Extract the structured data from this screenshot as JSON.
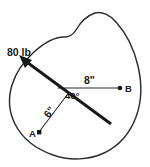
{
  "figure": {
    "colors": {
      "outline": "#2b2c2f",
      "force": "#17181a",
      "dimension": "#2b2c2f",
      "text": "#17181a",
      "background": "#ffffff"
    },
    "labels": {
      "force": "80 lb",
      "dim_b": "8\"",
      "dim_a": "6\"",
      "angle": "40°",
      "point_a": "A",
      "point_b": "B"
    },
    "geometry": {
      "force_line": {
        "x1": 22,
        "y1": 58,
        "x2": 111,
        "y2": 124
      },
      "arrow_tip": {
        "x": 20,
        "y": 56
      },
      "intersection": {
        "x": 66,
        "y": 91
      },
      "line_to_b": {
        "x1": 58,
        "y1": 88,
        "x2": 120,
        "y2": 88
      },
      "line_to_a": {
        "x1": 66,
        "y1": 96,
        "x2": 39,
        "y2": 133
      },
      "point_a_dot": {
        "x": 39,
        "y": 133
      },
      "point_b_dot": {
        "x": 120,
        "y": 88
      }
    },
    "values": {
      "force_magnitude": 80,
      "force_units": "lb",
      "distance_to_b": 8,
      "distance_to_a": 6,
      "distance_units": "in",
      "angle_degrees": 40
    }
  }
}
